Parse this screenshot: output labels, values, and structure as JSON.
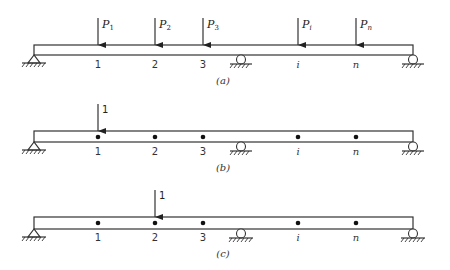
{
  "diagram": {
    "type": "beam-influence-loading",
    "colors": {
      "stroke": "#333333",
      "background": "#ffffff"
    },
    "points": [
      {
        "id": "1",
        "label": "1",
        "x": 98,
        "italic": false
      },
      {
        "id": "2",
        "label": "2",
        "x": 155,
        "italic": false
      },
      {
        "id": "3",
        "label": "3",
        "x": 203,
        "italic": false
      },
      {
        "id": "i",
        "label": "i",
        "x": 298,
        "italic": true
      },
      {
        "id": "n",
        "label": "n",
        "x": 356,
        "italic": true
      }
    ],
    "supports": [
      {
        "type": "pin",
        "x": 34
      },
      {
        "type": "roller",
        "x": 241
      },
      {
        "type": "roller",
        "x": 413
      }
    ],
    "panels": [
      {
        "caption": "(a)",
        "loads": [
          {
            "point": "1",
            "label": "P",
            "sub": "1"
          },
          {
            "point": "2",
            "label": "P",
            "sub": "2"
          },
          {
            "point": "3",
            "label": "P",
            "sub": "3"
          },
          {
            "point": "i",
            "label": "P",
            "sub": "i"
          },
          {
            "point": "n",
            "label": "P",
            "sub": "n"
          }
        ],
        "show_dots": false
      },
      {
        "caption": "(b)",
        "loads": [
          {
            "point": "1",
            "label": "1"
          }
        ],
        "show_dots": true
      },
      {
        "caption": "(c)",
        "loads": [
          {
            "point": "2",
            "label": "1"
          }
        ],
        "show_dots": true
      }
    ],
    "text": {
      "a": {
        "p1": "P",
        "p1s": "1",
        "p2": "P",
        "p2s": "2",
        "p3": "P",
        "p3s": "3",
        "pi": "P",
        "pis": "i",
        "pn": "P",
        "pns": "n",
        "caption": "(a)"
      },
      "b": {
        "load": "1",
        "caption": "(b)"
      },
      "c": {
        "load": "1",
        "caption": "(c)"
      },
      "labels": {
        "n1": "1",
        "n2": "2",
        "n3": "3",
        "ni": "i",
        "nn": "n"
      }
    }
  }
}
